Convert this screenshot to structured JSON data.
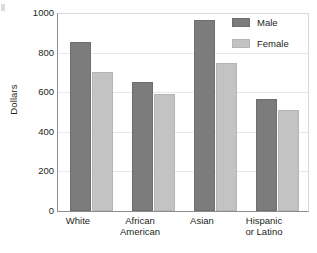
{
  "chart_data": {
    "type": "bar",
    "title": "",
    "subtitle": "",
    "xlabel": "",
    "ylabel": "Dollars",
    "categories": [
      "White",
      "African American",
      "Asian",
      "Hispanic or Latino"
    ],
    "category_lines": [
      [
        "White"
      ],
      [
        "African",
        "American"
      ],
      [
        "Asian"
      ],
      [
        "Hispanic",
        "or Latino"
      ]
    ],
    "series": [
      {
        "name": "Male",
        "values": [
          855,
          650,
          965,
          565
        ],
        "color": "#7c7c7c"
      },
      {
        "name": "Female",
        "values": [
          700,
          590,
          748,
          512
        ],
        "color": "#c3c3c3"
      }
    ],
    "ylim": [
      0,
      1000
    ],
    "yticks": [
      0,
      200,
      400,
      600,
      800,
      1000
    ],
    "ytick_labels": [
      "0",
      "200",
      "400",
      "600",
      "800",
      "1000"
    ],
    "grid": true,
    "grid_axis": "y",
    "legend_position": "top-right",
    "legend_entries": [
      "Male",
      "Female"
    ]
  },
  "axes": {
    "y_title": "Dollars"
  },
  "legend": {
    "male_label": "Male",
    "female_label": "Female"
  },
  "colors": {
    "male": "#7c7c7c",
    "female": "#c3c3c3",
    "axis": "#8d8d8d",
    "grid": "#e8e8e8",
    "text": "#231f20",
    "background": "#ffffff"
  }
}
